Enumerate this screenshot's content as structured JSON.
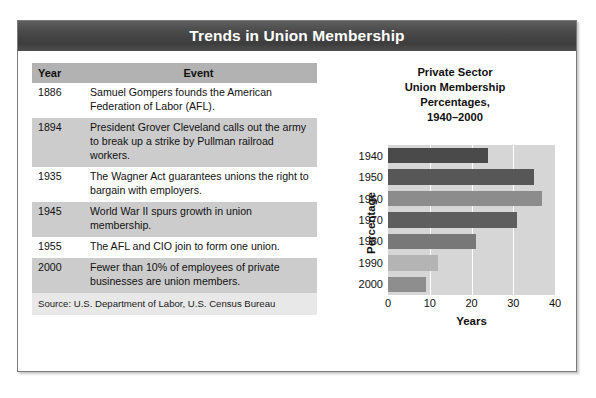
{
  "figure": {
    "title": "Trends in Union Membership"
  },
  "table": {
    "headers": [
      "Year",
      "Event"
    ],
    "rows": [
      {
        "year": "1886",
        "event": "Samuel Gompers founds the American Federation of Labor (AFL)."
      },
      {
        "year": "1894",
        "event": "President Grover Cleveland calls out the army to break up a strike by Pullman railroad workers."
      },
      {
        "year": "1935",
        "event": "The Wagner Act guarantees unions the right to bargain with employers."
      },
      {
        "year": "1945",
        "event": "World War II spurs growth in union membership."
      },
      {
        "year": "1955",
        "event": "The AFL and CIO join to form one union."
      },
      {
        "year": "2000",
        "event": "Fewer than 10% of employees of private businesses are union members."
      }
    ],
    "source": "Source: U.S. Department of Labor, U.S. Census Bureau"
  },
  "chart_data": {
    "type": "bar",
    "orientation": "horizontal",
    "title": "Private Sector\nUnion Membership\nPercentages,\n1940–2000",
    "title_lines": [
      "Private Sector",
      "Union Membership",
      "Percentages,",
      "1940–2000"
    ],
    "categories": [
      "1940",
      "1950",
      "1960",
      "1970",
      "1980",
      "1990",
      "2000"
    ],
    "values": [
      24,
      35,
      37,
      31,
      21,
      12,
      9
    ],
    "bar_colors": [
      "#4a4a4a",
      "#575757",
      "#8c8c8c",
      "#5e5e5e",
      "#787878",
      "#b4b4b4",
      "#8e8e8e"
    ],
    "xlabel": "Years",
    "ylabel": "Percentage",
    "xticks": [
      0,
      10,
      20,
      30,
      40
    ],
    "xtick_labels": [
      "0",
      "10",
      "20",
      "30",
      "40"
    ],
    "xlim": [
      0,
      40
    ],
    "grid": true,
    "grid_color": "#ffffff",
    "plot_background": "#d6d6d6",
    "legend": "none"
  },
  "colors": {
    "title_bar": "#444444",
    "title_text": "#ffffff",
    "table_header": "#b2b2b2",
    "table_row_alt": "#cccccc",
    "table_row_plain": "#ffffff",
    "source_row": "#e8e8e8",
    "frame_border": "#7a7a7a"
  }
}
